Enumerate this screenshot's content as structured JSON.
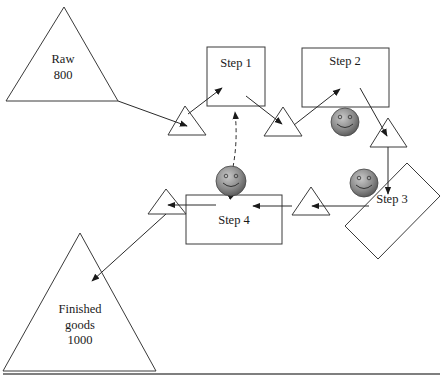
{
  "diagram": {
    "type": "process flow / value stream",
    "nodes": {
      "raw": {
        "line1": "Raw",
        "line2": "800"
      },
      "step1": {
        "label": "Step 1"
      },
      "step2": {
        "label": "Step 2"
      },
      "step3": {
        "label": "Step 3"
      },
      "step4": {
        "label": "Step 4"
      },
      "finished": {
        "line1": "Finished",
        "line2": "goods",
        "line3": "1000"
      }
    },
    "inventory_triangles": [
      "raw-to-step1",
      "step1-to-step2",
      "step2-to-step3",
      "step3-to-step4",
      "step4-to-finished"
    ],
    "operators": [
      "operator-step1-step4",
      "operator-step2",
      "operator-step3"
    ],
    "flow": [
      "Raw -> inventory -> Step 1",
      "Step 1 -> inventory -> Step 2",
      "Step 2 -> inventory -> Step 3",
      "Step 3 -> inventory -> Step 4",
      "Step 4 -> inventory -> Finished goods"
    ],
    "colors": {
      "stroke": "#3a3a3a",
      "operator_fill_light": "#bdbdbd",
      "operator_fill_dark": "#5a5a5a",
      "background": "#ffffff"
    }
  }
}
